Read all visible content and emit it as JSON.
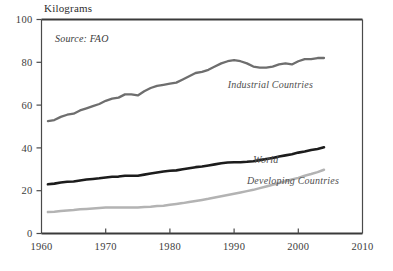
{
  "chart_data": {
    "type": "line",
    "title": "Kilograms",
    "subtitle": "Source: FAO",
    "xlabel": "",
    "ylabel": "Kilograms",
    "xlim": [
      1960,
      2010
    ],
    "ylim": [
      0,
      100
    ],
    "xticks": [
      1960,
      1970,
      1980,
      1990,
      2000,
      2010
    ],
    "xticklabels": [
      "1960",
      "1970",
      "1980",
      "1990",
      "2000",
      "2010"
    ],
    "yticks": [
      0,
      20,
      40,
      60,
      80,
      100
    ],
    "yticklabels": [
      "0",
      "20",
      "40",
      "60",
      "80",
      "100"
    ],
    "grid": false,
    "legend_position": "inline-annotation",
    "series": [
      {
        "name": "Industrial Countries",
        "color": "#6e6e6e",
        "label_x": 1989,
        "label_y": 68,
        "x": [
          1961,
          1962,
          1963,
          1964,
          1965,
          1966,
          1967,
          1968,
          1969,
          1970,
          1971,
          1972,
          1973,
          1974,
          1975,
          1976,
          1977,
          1978,
          1979,
          1980,
          1981,
          1982,
          1983,
          1984,
          1985,
          1986,
          1987,
          1988,
          1989,
          1990,
          1991,
          1992,
          1993,
          1994,
          1995,
          1996,
          1997,
          1998,
          1999,
          2000,
          2001,
          2002,
          2003,
          2004
        ],
        "values": [
          52.5,
          53.0,
          54.5,
          55.5,
          56.0,
          57.5,
          58.5,
          59.5,
          60.5,
          62.0,
          63.0,
          63.5,
          65.0,
          65.0,
          64.5,
          66.5,
          68.0,
          69.0,
          69.5,
          70.0,
          70.5,
          72.0,
          73.5,
          75.0,
          75.5,
          76.5,
          78.0,
          79.5,
          80.5,
          81.0,
          80.5,
          79.5,
          78.0,
          77.5,
          77.5,
          78.0,
          79.0,
          79.5,
          79.0,
          80.5,
          81.5,
          81.5,
          82.0,
          82.0
        ]
      },
      {
        "name": "World",
        "color": "#1c1c1c",
        "label_x": 1993,
        "label_y": 33,
        "x": [
          1961,
          1962,
          1963,
          1964,
          1965,
          1966,
          1967,
          1968,
          1969,
          1970,
          1971,
          1972,
          1973,
          1974,
          1975,
          1976,
          1977,
          1978,
          1979,
          1980,
          1981,
          1982,
          1983,
          1984,
          1985,
          1986,
          1987,
          1988,
          1989,
          1990,
          1991,
          1992,
          1993,
          1994,
          1995,
          1996,
          1997,
          1998,
          1999,
          2000,
          2001,
          2002,
          2003,
          2004
        ],
        "values": [
          23.0,
          23.3,
          23.8,
          24.2,
          24.3,
          24.8,
          25.2,
          25.5,
          25.8,
          26.2,
          26.5,
          26.6,
          27.0,
          27.0,
          27.0,
          27.5,
          28.0,
          28.5,
          29.0,
          29.3,
          29.5,
          30.0,
          30.5,
          31.0,
          31.3,
          31.8,
          32.3,
          32.8,
          33.2,
          33.3,
          33.3,
          33.5,
          33.8,
          34.3,
          34.8,
          35.3,
          36.0,
          36.5,
          37.0,
          37.8,
          38.3,
          39.0,
          39.5,
          40.3
        ]
      },
      {
        "name": "Developing Countries",
        "color": "#b3b3b3",
        "label_x": 1992,
        "label_y": 23,
        "x": [
          1961,
          1962,
          1963,
          1964,
          1965,
          1966,
          1967,
          1968,
          1969,
          1970,
          1971,
          1972,
          1973,
          1974,
          1975,
          1976,
          1977,
          1978,
          1979,
          1980,
          1981,
          1982,
          1983,
          1984,
          1985,
          1986,
          1987,
          1988,
          1989,
          1990,
          1991,
          1992,
          1993,
          1994,
          1995,
          1996,
          1997,
          1998,
          1999,
          2000,
          2001,
          2002,
          2003,
          2004
        ],
        "values": [
          10.0,
          10.2,
          10.5,
          10.8,
          11.0,
          11.3,
          11.5,
          11.7,
          11.9,
          12.1,
          12.2,
          12.1,
          12.2,
          12.1,
          12.2,
          12.4,
          12.5,
          12.8,
          13.0,
          13.4,
          13.8,
          14.2,
          14.7,
          15.2,
          15.7,
          16.2,
          16.8,
          17.4,
          18.0,
          18.6,
          19.2,
          19.8,
          20.4,
          21.2,
          22.0,
          22.8,
          23.6,
          24.4,
          25.2,
          26.0,
          27.0,
          27.8,
          28.7,
          29.8
        ]
      }
    ]
  },
  "annotations": {
    "title_text": "Kilograms",
    "source_text": "Source: FAO"
  }
}
